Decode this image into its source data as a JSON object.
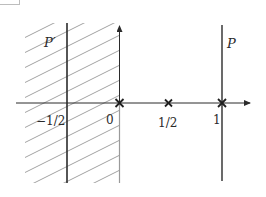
{
  "diagram": {
    "type": "complex-plane-pole-zero-regions",
    "colors": {
      "line": "#2b2b2b",
      "hatch": "#8a8a8a",
      "axis": "#333333",
      "faint_axis": "#9a9a9a"
    },
    "regions": [
      {
        "name": "P'",
        "description": "hatched half-plane left of the imaginary axis (Re < 0)",
        "hatched": true
      }
    ],
    "lines": [
      {
        "label": "P'",
        "position": -0.5,
        "orientation": "vertical"
      },
      {
        "label": "P",
        "position": 1,
        "orientation": "vertical"
      }
    ],
    "markers": [
      {
        "symbol": "x",
        "position": 0
      },
      {
        "symbol": "x",
        "position": 0.5
      },
      {
        "symbol": "x",
        "position": 1
      }
    ],
    "labels": {
      "p_prime": "P′",
      "p": "P",
      "tick_neg_half": "−1/2",
      "tick_zero": "0",
      "tick_half": "1/2",
      "tick_one": "1"
    }
  }
}
